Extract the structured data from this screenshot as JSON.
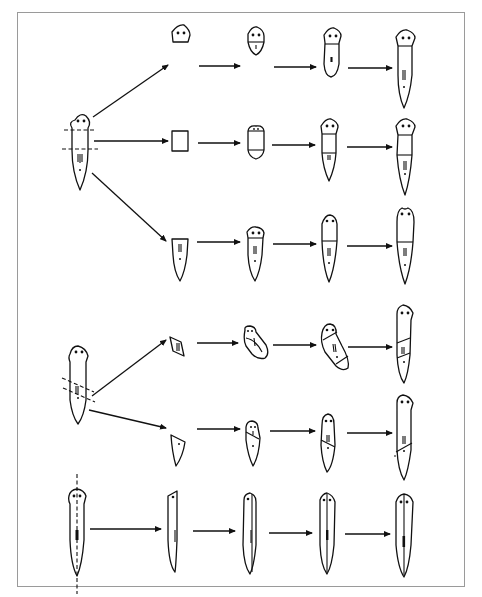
{
  "figure": {
    "colors": {
      "ink": "#111111",
      "frame": "#9a9a9a",
      "background": "#ffffff"
    },
    "rows": [
      {
        "name": "transverse-head-fragment",
        "stages": 4,
        "description": "Head fragment regenerates trunk and tail"
      },
      {
        "name": "transverse-middle-fragment",
        "stages": 4,
        "description": "Middle fragment regenerates head and tail"
      },
      {
        "name": "transverse-tail-fragment",
        "stages": 4,
        "description": "Tail fragment regenerates head"
      },
      {
        "name": "oblique-middle-fragment",
        "stages": 4,
        "description": "Oblique middle piece regenerates whole worm"
      },
      {
        "name": "oblique-tail-fragment",
        "stages": 4,
        "description": "Oblique tail piece regenerates head"
      },
      {
        "name": "longitudinal-half",
        "stages": 4,
        "description": "Longitudinal half regenerates missing side"
      }
    ],
    "cut_types": [
      "transverse",
      "oblique",
      "longitudinal"
    ]
  }
}
